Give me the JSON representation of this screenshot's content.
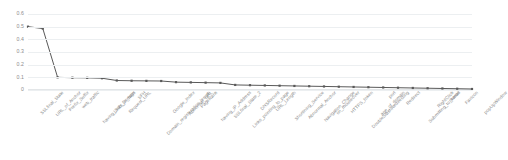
{
  "chart_data": {
    "type": "line",
    "title": "",
    "xlabel": "",
    "ylabel": "",
    "ylim": [
      0,
      0.6
    ],
    "grid": true,
    "legend": "none",
    "yticks": [
      "0",
      "0.1",
      "0.2",
      "0.3",
      "0.4",
      "0.5",
      "0.6"
    ],
    "ytick_values": [
      0,
      0.1,
      0.2,
      0.3,
      0.4,
      0.5,
      0.6
    ],
    "series_color": "#595959",
    "marker": "square",
    "categories": [
      "SSLfinal_State",
      "URL_of_Anchor",
      "Prefix_Suffix",
      "web_traffic",
      "having_Sub_Domain",
      "Links_in_tags",
      "Request_URL",
      "SFH",
      "Domain_registeration_length",
      "Google_Index",
      "Abnormal_URL",
      "PageRank",
      "having_IP_Address",
      "SSLfinal_State_2",
      "Links_pointing_to_page",
      "DNSRecord",
      "URL_Length",
      "Shortining_Service",
      "Abnormal_Anchor",
      "Navigation_Change",
      "on_mouseover",
      "HTTPS_token",
      "DoubleSlashRedirecting",
      "age_of_domain",
      "port",
      "Redirect",
      "Submitting_to_email",
      "RightClick",
      "Iframe",
      "Favicon",
      "popUpWindow"
    ],
    "values": [
      0.5,
      0.485,
      0.1,
      0.097,
      0.096,
      0.093,
      0.075,
      0.073,
      0.072,
      0.071,
      0.062,
      0.06,
      0.058,
      0.056,
      0.04,
      0.038,
      0.036,
      0.034,
      0.032,
      0.03,
      0.028,
      0.026,
      0.024,
      0.022,
      0.02,
      0.018,
      0.016,
      0.014,
      0.012,
      0.01,
      0.008
    ]
  }
}
